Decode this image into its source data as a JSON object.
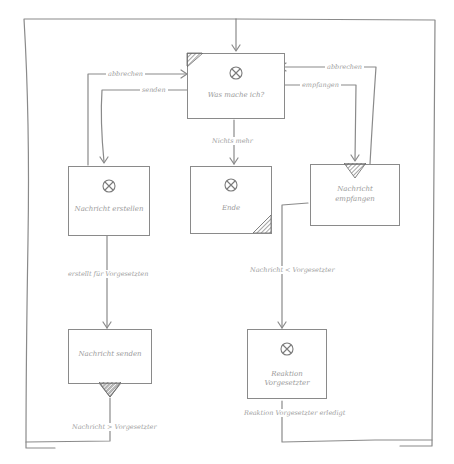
{
  "diagram": {
    "type": "flowchart",
    "style": "hand-drawn sketch",
    "stroke_color": "#8a8a8a",
    "text_color": "#9a9a9a",
    "nodes": [
      {
        "id": "was_mache_ich",
        "label": "Was mache ich?",
        "has_x_icon": true,
        "marker": "hatched-top-left-corner"
      },
      {
        "id": "nachricht_erstellen",
        "label": "Nachricht erstellen",
        "has_x_icon": true
      },
      {
        "id": "ende",
        "label": "Ende",
        "has_x_icon": true,
        "marker": "hatched-bottom-right-corner"
      },
      {
        "id": "nachricht_empfangen",
        "label_line1": "Nachricht",
        "label_line2": "empfangen",
        "has_x_icon": false,
        "marker": "hatched-triangle-top"
      },
      {
        "id": "nachricht_senden",
        "label": "Nachricht senden",
        "has_x_icon": false,
        "marker": "hatched-triangle-bottom"
      },
      {
        "id": "reaktion_vorgesetzter",
        "label": "Reaktion Vorgesetzter",
        "has_x_icon": true
      }
    ],
    "edges": [
      {
        "from": "nachricht_erstellen",
        "to": "was_mache_ich",
        "label": "abbrechen"
      },
      {
        "from": "was_mache_ich",
        "to": "nachricht_erstellen",
        "label": "senden"
      },
      {
        "from": "nachricht_empfangen",
        "to": "was_mache_ich",
        "label": "abbrechen"
      },
      {
        "from": "was_mache_ich",
        "to": "nachricht_empfangen",
        "label": "empfangen"
      },
      {
        "from": "was_mache_ich",
        "to": "ende",
        "label": "Nichts mehr"
      },
      {
        "from": "nachricht_erstellen",
        "to": "nachricht_senden",
        "label": "erstellt für Vorgesetzten"
      },
      {
        "from": "nachricht_empfangen",
        "to": "reaktion_vorgesetzter",
        "label": "Nachricht < Vorgesetzter"
      },
      {
        "from": "nachricht_senden",
        "to": "was_mache_ich",
        "label": "Nachricht > Vorgesetzter"
      },
      {
        "from": "reaktion_vorgesetzter",
        "to": "was_mache_ich",
        "label": "Reaktion Vorgesetzter erledigt"
      }
    ]
  },
  "labels": {
    "node_was_mache_ich": "Was mache ich?",
    "node_nachricht_erstellen": "Nachricht erstellen",
    "node_ende": "Ende",
    "node_nachricht_empfangen_1": "Nachricht",
    "node_nachricht_empfangen_2": "empfangen",
    "node_nachricht_senden": "Nachricht senden",
    "node_reaktion_vorgesetzter": "Reaktion Vorgesetzter",
    "edge_abbrechen_left": "abbrechen",
    "edge_senden": "senden",
    "edge_abbrechen_right": "abbrechen",
    "edge_empfangen": "empfangen",
    "edge_nichts_mehr": "Nichts mehr",
    "edge_erstellt": "erstellt für Vorgesetzten",
    "edge_nachricht_lt": "Nachricht < Vorgesetzter",
    "edge_nachricht_gt": "Nachricht > Vorgesetzter",
    "edge_reaktion_erledigt": "Reaktion Vorgesetzter erledigt"
  }
}
